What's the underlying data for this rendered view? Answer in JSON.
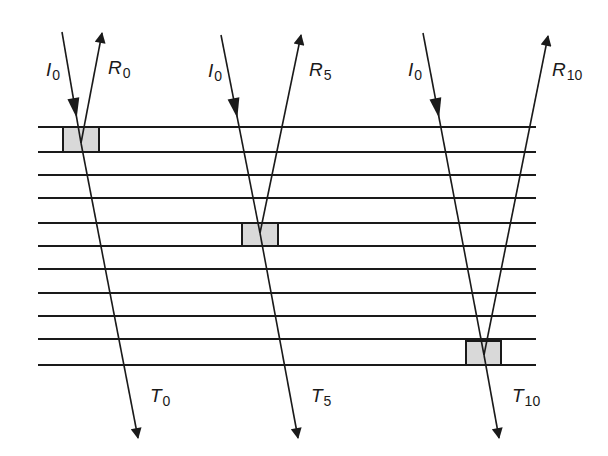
{
  "colors": {
    "line": "#1a1a1a",
    "box_fill": "#d9d9d9",
    "background": "#ffffff"
  },
  "layers": {
    "x_start": 38,
    "x_end": 536,
    "y_positions": [
      127,
      152,
      175,
      198,
      223,
      246,
      269,
      293,
      316,
      339,
      365
    ]
  },
  "rays": [
    {
      "id": "ray-0",
      "incident": {
        "label": "I",
        "sub": "0",
        "from": [
          62,
          32
        ],
        "label_pos": [
          46,
          60
        ]
      },
      "vertex": [
        81,
        143
      ],
      "reflected": {
        "label": "R",
        "sub": "0",
        "to": [
          102,
          33
        ],
        "label_pos": [
          108,
          58
        ]
      },
      "transmitted": {
        "label": "T",
        "sub": "0",
        "to": [
          138,
          438
        ],
        "label_pos": [
          150,
          386
        ]
      },
      "box": {
        "x": 63,
        "y": 127,
        "w": 36,
        "h": 25
      }
    },
    {
      "id": "ray-5",
      "incident": {
        "label": "I",
        "sub": "0",
        "from": [
          221,
          35
        ],
        "label_pos": [
          208,
          61
        ]
      },
      "vertex": [
        260,
        233
      ],
      "reflected": {
        "label": "R",
        "sub": "5",
        "to": [
          301,
          35
        ],
        "label_pos": [
          309,
          60
        ]
      },
      "transmitted": {
        "label": "T",
        "sub": "5",
        "to": [
          298,
          438
        ],
        "label_pos": [
          311,
          386
        ]
      },
      "box": {
        "x": 242,
        "y": 223,
        "w": 36,
        "h": 23
      }
    },
    {
      "id": "ray-10",
      "incident": {
        "label": "I",
        "sub": "0",
        "from": [
          423,
          33
        ],
        "label_pos": [
          408,
          60
        ]
      },
      "vertex": [
        484,
        355
      ],
      "reflected": {
        "label": "R",
        "sub": "10",
        "to": [
          548,
          36
        ],
        "label_pos": [
          552,
          60
        ]
      },
      "transmitted": {
        "label": "T",
        "sub": "10",
        "to": [
          499,
          438
        ],
        "label_pos": [
          512,
          386
        ]
      },
      "box": {
        "x": 466,
        "y": 341,
        "w": 35,
        "h": 24
      }
    }
  ]
}
